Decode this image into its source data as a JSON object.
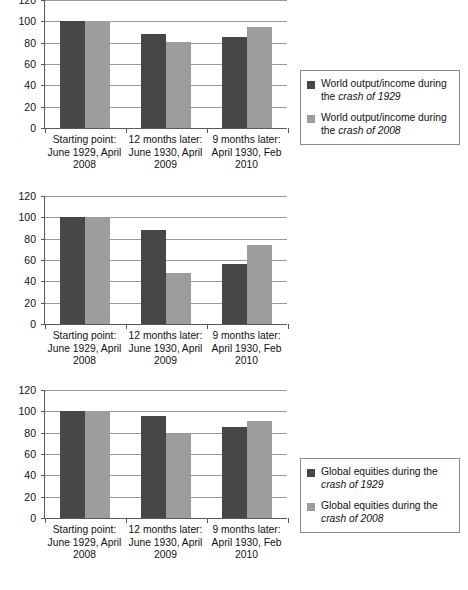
{
  "chart_data": [
    {
      "type": "bar",
      "title": "World output/income: crash of 1929 vs crash of 2008",
      "xlabel": "",
      "ylabel": "",
      "ylim": [
        0,
        120
      ],
      "yticks": [
        0,
        20,
        40,
        60,
        80,
        100,
        120
      ],
      "grid": true,
      "legend_position": "right",
      "categories": [
        "Starting point: June 1929, April 2008",
        "12 months later: June 1930, April 2009",
        "9 months later: April 1930, Feb 2010"
      ],
      "category_lines": [
        [
          "Starting point:",
          "June 1929, April",
          "2008"
        ],
        [
          "12 months later:",
          "June 1930, April",
          "2009"
        ],
        [
          "9 months later:",
          "April 1930, Feb",
          "2010"
        ]
      ],
      "series": [
        {
          "name": "World output/income during the crash of 1929",
          "name_plain": "World output/income during the",
          "name_italic": "crash of 1929",
          "color": "#474747",
          "values": [
            100,
            88,
            85
          ]
        },
        {
          "name": "World output/income during the crash of 2008",
          "name_plain": "World output/income during the",
          "name_italic": "crash of 2008",
          "color": "#9d9d9d",
          "values": [
            100,
            81,
            95
          ]
        }
      ]
    },
    {
      "type": "bar",
      "title": "Global equities: crash of 1929 vs crash of 2008",
      "xlabel": "",
      "ylabel": "",
      "ylim": [
        0,
        120
      ],
      "yticks": [
        0,
        20,
        40,
        60,
        80,
        100,
        120
      ],
      "grid": true,
      "legend_position": "right",
      "categories": [
        "Starting point: June 1929, April 2008",
        "12 months later: June 1930, April 2009",
        "9 months later: April 1930, Feb 2010"
      ],
      "category_lines": [
        [
          "Starting point:",
          "June 1929, April",
          "2008"
        ],
        [
          "12 months later:",
          "June 1930, April",
          "2009"
        ],
        [
          "9 months later:",
          "April 1930, Feb",
          "2010"
        ]
      ],
      "series": [
        {
          "name": "Global equities during the crash of 1929",
          "name_plain": "Global equities during the",
          "name_italic": "crash of 1929",
          "color": "#474747",
          "values": [
            100,
            88,
            56
          ]
        },
        {
          "name": "Global equities during the crash of 2008",
          "name_plain": "Global equities during the",
          "name_italic": "crash of 2008",
          "color": "#9d9d9d",
          "values": [
            100,
            48,
            74
          ]
        }
      ]
    },
    {
      "type": "bar",
      "title": "Global trade: crash of 1929 vs crash of 2008",
      "xlabel": "",
      "ylabel": "",
      "ylim": [
        0,
        120
      ],
      "yticks": [
        0,
        20,
        40,
        60,
        80,
        100,
        120
      ],
      "grid": true,
      "legend_position": "right",
      "categories": [
        "Starting point: June 1929, April 2008",
        "12 months later: June 1930, April 2009",
        "9 months later: April 1930, Feb 2010"
      ],
      "category_lines": [
        [
          "Starting point:",
          "June 1929, April",
          "2008"
        ],
        [
          "12 months later:",
          "June 1930, April",
          "2009"
        ],
        [
          "9 months later:",
          "April 1930, Feb",
          "2010"
        ]
      ],
      "series": [
        {
          "name": "Global trade during the crash of 1929",
          "name_plain": "Global trade during the",
          "name_italic": "crash of 1929",
          "color": "#474747",
          "values": [
            100,
            96,
            85
          ]
        },
        {
          "name": "Global trade during the crash of 2008",
          "name_plain": "Global trade during the",
          "name_italic": "crash of 2008",
          "color": "#9d9d9d",
          "values": [
            100,
            79,
            91
          ]
        }
      ]
    }
  ]
}
